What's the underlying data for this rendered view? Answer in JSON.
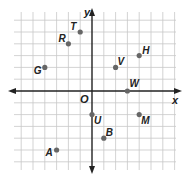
{
  "diagram": {
    "type": "coordinate-plane",
    "axes": {
      "x_label": "x",
      "y_label": "y",
      "origin_label": "O"
    },
    "grid": {
      "x_min": -6,
      "x_max": 7,
      "y_min": -6,
      "y_max": 6
    },
    "colors": {
      "grid": "#c8c8c8",
      "axis": "#222222",
      "point": "#666666",
      "label": "#222222"
    },
    "points": [
      {
        "label": "T",
        "x": -1,
        "y": 5,
        "label_dx": -10,
        "label_dy": -2
      },
      {
        "label": "R",
        "x": -2,
        "y": 4,
        "label_dx": -10,
        "label_dy": -2
      },
      {
        "label": "G",
        "x": -4,
        "y": 2,
        "label_dx": -11,
        "label_dy": 7
      },
      {
        "label": "V",
        "x": 2,
        "y": 2,
        "label_dx": 2,
        "label_dy": -2
      },
      {
        "label": "H",
        "x": 4,
        "y": 3,
        "label_dx": 3,
        "label_dy": -2
      },
      {
        "label": "W",
        "x": 3,
        "y": 0,
        "label_dx": 2,
        "label_dy": -4
      },
      {
        "label": "U",
        "x": 0,
        "y": -2,
        "label_dx": 2,
        "label_dy": 9
      },
      {
        "label": "B",
        "x": 1,
        "y": -4,
        "label_dx": 2,
        "label_dy": -2
      },
      {
        "label": "M",
        "x": 4,
        "y": -2,
        "label_dx": 2,
        "label_dy": 9
      },
      {
        "label": "A",
        "x": -3,
        "y": -5,
        "label_dx": -11,
        "label_dy": 6
      }
    ]
  }
}
